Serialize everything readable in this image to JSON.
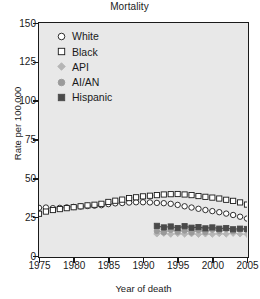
{
  "chart_data": {
    "type": "scatter",
    "title": "Mortality",
    "xlabel": "Year of death",
    "ylabel": "Rate per 100,000",
    "xlim": [
      1975,
      2005
    ],
    "ylim": [
      0,
      150
    ],
    "xticks": [
      1975,
      1980,
      1985,
      1990,
      1995,
      2000,
      2005
    ],
    "yticks": [
      0,
      25,
      50,
      75,
      100,
      125,
      150
    ],
    "grid": false,
    "legend_position": "upper-left",
    "series": [
      {
        "name": "White",
        "marker": "open-circle",
        "color": "#ffffff",
        "edge_color": "#1a1a1a",
        "x": [
          1975,
          1976,
          1977,
          1978,
          1979,
          1980,
          1981,
          1982,
          1983,
          1984,
          1985,
          1986,
          1987,
          1988,
          1989,
          1990,
          1991,
          1992,
          1993,
          1994,
          1995,
          1996,
          1997,
          1998,
          1999,
          2000,
          2001,
          2002,
          2003,
          2004,
          2005
        ],
        "values": [
          31.0,
          31.2,
          30.8,
          31.0,
          31.3,
          31.6,
          31.9,
          32.2,
          32.4,
          32.7,
          33.4,
          33.9,
          34.1,
          34.4,
          34.6,
          34.6,
          34.5,
          34.2,
          34.0,
          33.6,
          32.9,
          32.0,
          31.2,
          30.4,
          29.6,
          28.9,
          28.2,
          27.3,
          26.4,
          25.3,
          24.1
        ]
      },
      {
        "name": "Black",
        "marker": "open-square",
        "color": "#ffffff",
        "edge_color": "#1a1a1a",
        "x": [
          1975,
          1976,
          1977,
          1978,
          1979,
          1980,
          1981,
          1982,
          1983,
          1984,
          1985,
          1986,
          1987,
          1988,
          1989,
          1990,
          1991,
          1992,
          1993,
          1994,
          1995,
          1996,
          1997,
          1998,
          1999,
          2000,
          2001,
          2002,
          2003,
          2004,
          2005
        ],
        "values": [
          27.2,
          28.6,
          29.6,
          30.2,
          30.8,
          31.4,
          32.0,
          32.6,
          33.0,
          33.6,
          34.8,
          35.6,
          36.3,
          37.3,
          37.8,
          38.4,
          38.8,
          39.2,
          39.6,
          39.8,
          39.9,
          39.6,
          39.2,
          38.6,
          38.1,
          37.6,
          37.0,
          36.2,
          35.5,
          34.5,
          33.1
        ]
      },
      {
        "name": "API",
        "marker": "filled-diamond",
        "color": "#b5b5b5",
        "edge_color": "#b5b5b5",
        "x": [
          1992,
          1993,
          1994,
          1995,
          1996,
          1997,
          1998,
          1999,
          2000,
          2001,
          2002,
          2003,
          2004,
          2005
        ],
        "values": [
          14.2,
          14.6,
          14.0,
          14.4,
          14.1,
          14.3,
          13.9,
          14.2,
          14.0,
          14.4,
          14.1,
          14.6,
          14.2,
          14.0
        ]
      },
      {
        "name": "AI/AN",
        "marker": "filled-circle",
        "color": "#9a9a9a",
        "edge_color": "#9a9a9a",
        "x": [
          1992,
          1993,
          1994,
          1995,
          1996,
          1997,
          1998,
          1999,
          2000,
          2001,
          2002,
          2003,
          2004,
          2005
        ],
        "values": [
          16.1,
          15.2,
          16.8,
          15.6,
          16.4,
          15.1,
          16.6,
          15.4,
          17.0,
          16.2,
          17.4,
          16.0,
          17.2,
          16.6
        ]
      },
      {
        "name": "Hispanic",
        "marker": "filled-square",
        "color": "#4a4a4a",
        "edge_color": "#4a4a4a",
        "x": [
          1992,
          1993,
          1994,
          1995,
          1996,
          1997,
          1998,
          1999,
          2000,
          2001,
          2002,
          2003,
          2004,
          2005
        ],
        "values": [
          19.4,
          18.4,
          19.0,
          18.0,
          19.2,
          18.2,
          18.6,
          17.8,
          18.4,
          17.6,
          18.0,
          17.2,
          17.6,
          17.4
        ]
      }
    ]
  },
  "chart": {
    "title": "Mortality",
    "xlabel": "Year of death",
    "ylabel": "Rate per 100,000",
    "yticks": [
      "150",
      "125",
      "100",
      "75",
      "50",
      "25",
      "0"
    ],
    "xticks": [
      "1975",
      "1980",
      "1985",
      "1990",
      "1995",
      "2000",
      "2005"
    ]
  },
  "legend": {
    "items": [
      {
        "label": "White",
        "marker": "open-circle-icon"
      },
      {
        "label": "Black",
        "marker": "open-square-icon"
      },
      {
        "label": "API",
        "marker": "filled-diamond-icon"
      },
      {
        "label": "AI/AN",
        "marker": "filled-circle-icon"
      },
      {
        "label": "Hispanic",
        "marker": "filled-square-icon"
      }
    ]
  },
  "style": {
    "plot_background": "#e8e8e8",
    "axis_color": "#1a1a1a",
    "figure_background": "#ffffff"
  }
}
